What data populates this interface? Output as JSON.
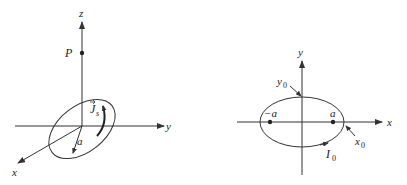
{
  "figures": [
    {
      "id": "left-3d-loop",
      "labels": {
        "z_axis": "z",
        "y_axis": "y",
        "x_axis": "x",
        "point": "P",
        "current_symbol": "J",
        "current_sub": "s",
        "radius": "a"
      }
    },
    {
      "id": "right-2d-ellipse",
      "labels": {
        "y_axis": "y",
        "x_axis": "x",
        "neg_a": "−a",
        "pos_a": "a",
        "y0": "y",
        "y0_sub": "0",
        "x0": "x",
        "x0_sub": "0",
        "i0": "I",
        "i0_sub": "0"
      }
    }
  ],
  "colors": {
    "line": "#333333",
    "text": "#222222",
    "background": "#ffffff"
  }
}
